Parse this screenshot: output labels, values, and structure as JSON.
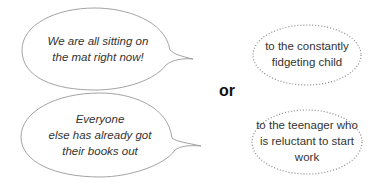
{
  "speech_bubbles": [
    {
      "lines": [
        "We are all sitting on",
        "the mat right now!"
      ]
    },
    {
      "lines": [
        "Everyone",
        "else has already got",
        "their books out"
      ]
    }
  ],
  "connector": "or",
  "thought_bubbles": [
    {
      "lines": [
        "to the constantly",
        "fidgeting child"
      ]
    },
    {
      "lines": [
        "to the teenager who",
        "is reluctant to start",
        "work"
      ]
    }
  ]
}
